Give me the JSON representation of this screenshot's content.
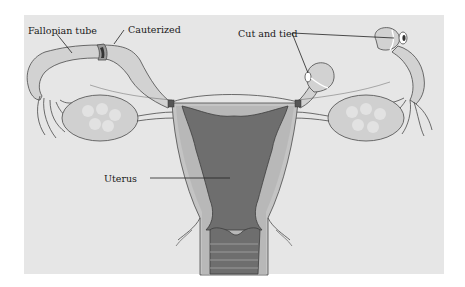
{
  "diagram": {
    "labels": {
      "fallopian_tube": "Fallopian tube",
      "cauterized": "Cauterized",
      "cut_and_tied": "Cut and tied",
      "uterus": "Uterus"
    },
    "colors": {
      "background": "#e6e6e6",
      "tissue_light": "#d2d2d2",
      "tissue_mid": "#b4b4b4",
      "cavity_dark": "#6e6e6e",
      "outline": "#4a4a4a"
    }
  }
}
